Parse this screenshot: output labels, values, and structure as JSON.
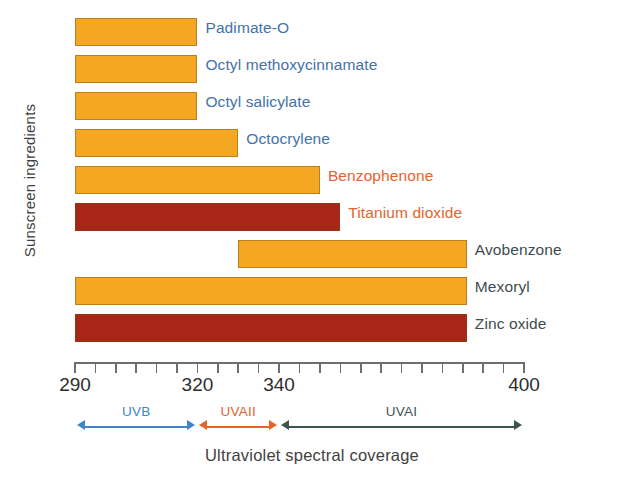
{
  "chart_data": {
    "type": "bar",
    "orientation": "horizontal",
    "title": "",
    "xlabel": "Ultraviolet spectral coverage",
    "ylabel": "Sunscreen ingredients",
    "xlim": [
      290,
      400
    ],
    "xunit": "nm",
    "grid": false,
    "legend": "none",
    "xticks": [
      290,
      295,
      300,
      305,
      310,
      315,
      320,
      325,
      330,
      335,
      340,
      345,
      350,
      355,
      360,
      365,
      370,
      375,
      380,
      385,
      390,
      395,
      400
    ],
    "xtick_labels_shown": [
      "290",
      "320",
      "340",
      "400"
    ],
    "categories": [
      "Padimate-O",
      "Octyl methoxycinnamate",
      "Octyl salicylate",
      "Octocrylene",
      "Benzophenone",
      "Titanium dioxide",
      "Avobenzone",
      "Mexoryl",
      "Zinc oxide"
    ],
    "bars": [
      {
        "label": "Padimate-O",
        "start": 290,
        "end": 320,
        "color": "#F5A623",
        "label_color": "#4472A8"
      },
      {
        "label": "Octyl methoxycinnamate",
        "start": 290,
        "end": 320,
        "color": "#F5A623",
        "label_color": "#4472A8"
      },
      {
        "label": "Octyl salicylate",
        "start": 290,
        "end": 320,
        "color": "#F5A623",
        "label_color": "#4472A8"
      },
      {
        "label": "Octocrylene",
        "start": 290,
        "end": 330,
        "color": "#F5A623",
        "label_color": "#4472A8"
      },
      {
        "label": "Benzophenone",
        "start": 290,
        "end": 350,
        "color": "#F5A623",
        "label_color": "#E3642C"
      },
      {
        "label": "Titanium dioxide",
        "start": 290,
        "end": 355,
        "color": "#A82617",
        "label_color": "#E3642C"
      },
      {
        "label": "Avobenzone",
        "start": 330,
        "end": 386,
        "color": "#F5A623",
        "label_color": "#3D4D4D"
      },
      {
        "label": "Mexoryl",
        "start": 290,
        "end": 386,
        "color": "#F5A623",
        "label_color": "#3D4D4D"
      },
      {
        "label": "Zinc oxide",
        "start": 290,
        "end": 386,
        "color": "#A82617",
        "label_color": "#3D4D4D"
      }
    ],
    "uv_bands": [
      {
        "name": "UVB",
        "start": 290,
        "end": 320,
        "color": "#3E86C8"
      },
      {
        "name": "UVAII",
        "start": 320,
        "end": 340,
        "color": "#E3642C"
      },
      {
        "name": "UVAI",
        "start": 340,
        "end": 400,
        "color": "#3D5453"
      }
    ]
  },
  "colors": {
    "bar_orange": "#F5A623",
    "bar_dark_red": "#A82617",
    "label_blue": "#4472A8",
    "label_orange": "#E3642C",
    "label_slate": "#3D4D4D",
    "axis_gray": "#6E6E6E",
    "background": "#FFFFFF"
  }
}
